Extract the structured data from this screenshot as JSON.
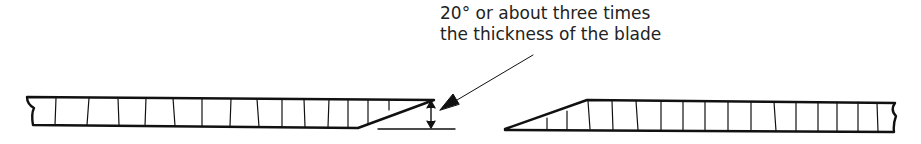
{
  "annotation": {
    "line1": "20° or about three times",
    "line2": "the thickness of the blade"
  },
  "diagram": {
    "stroke_color": "#111111",
    "left_blade": {
      "segments": 15
    },
    "right_blade": {
      "segments": 17
    }
  }
}
